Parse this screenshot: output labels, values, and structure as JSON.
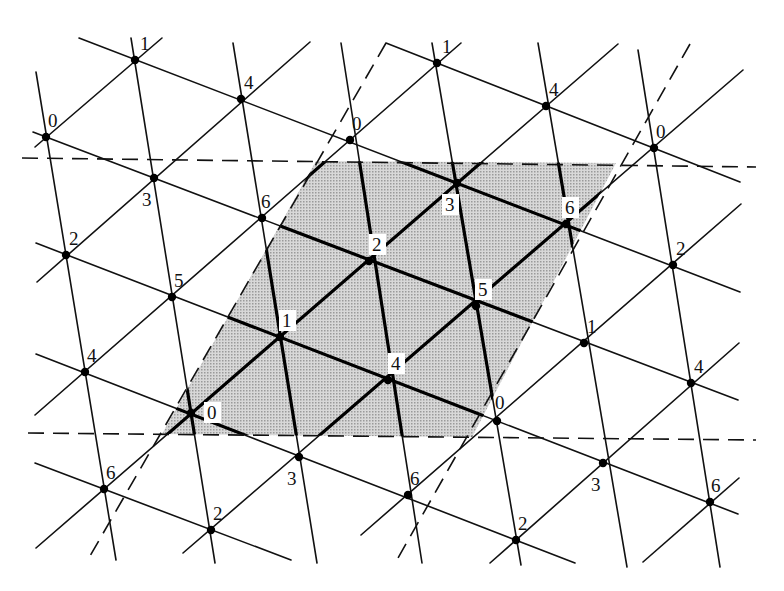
{
  "diagram": {
    "title": "",
    "type": "triangular lattice with residue labels mod 7 and shaded fundamental parallelogram",
    "colors": {
      "line": "#111111",
      "node": "#000000",
      "shade": "#c4c4c4",
      "background": "#ffffff"
    },
    "region": {
      "polygon": [
        [
          316,
          161
        ],
        [
          616,
          163
        ],
        [
          472,
          437
        ],
        [
          162,
          434
        ]
      ]
    },
    "dashed_lines": [
      [
        [
          22,
          158
        ],
        [
          756,
          167
        ]
      ],
      [
        [
          28,
          433
        ],
        [
          756,
          440
        ]
      ],
      [
        [
          386,
          43
        ],
        [
          90,
          556
        ]
      ],
      [
        [
          690,
          44
        ],
        [
          398,
          558
        ]
      ]
    ],
    "lines": [
      [
        [
          35,
          147
        ],
        [
          162,
          38
        ]
      ],
      [
        [
          37,
          282
        ],
        [
          310,
          42
        ]
      ],
      [
        [
          35,
          415
        ],
        [
          461,
          43
        ]
      ],
      [
        [
          36,
          548
        ],
        [
          618,
          44
        ]
      ],
      [
        [
          183,
          553
        ],
        [
          743,
          70
        ]
      ],
      [
        [
          361,
          535
        ],
        [
          741,
          204
        ]
      ],
      [
        [
          490,
          563
        ],
        [
          739,
          343
        ]
      ],
      [
        [
          643,
          562
        ],
        [
          739,
          478
        ]
      ],
      [
        [
          79,
          38
        ],
        [
          740,
          292
        ]
      ],
      [
        [
          33,
          132
        ],
        [
          738,
          400
        ]
      ],
      [
        [
          36,
          243
        ],
        [
          738,
          514
        ]
      ],
      [
        [
          36,
          354
        ],
        [
          575,
          563
        ]
      ],
      [
        [
          35,
          463
        ],
        [
          291,
          560
        ]
      ],
      [
        [
          386,
          43
        ],
        [
          740,
          182
        ]
      ],
      [
        [
          131,
          38
        ],
        [
          215,
          563
        ]
      ],
      [
        [
          36,
          72
        ],
        [
          116,
          560
        ]
      ],
      [
        [
          233,
          43
        ],
        [
          317,
          563
        ]
      ],
      [
        [
          341,
          43
        ],
        [
          422,
          563
        ]
      ],
      [
        [
          432,
          43
        ],
        [
          521,
          565
        ]
      ],
      [
        [
          538,
          43
        ],
        [
          627,
          567
        ]
      ],
      [
        [
          638,
          50
        ],
        [
          720,
          567
        ]
      ]
    ],
    "nodes": [
      {
        "x": 135,
        "y": 60,
        "label": "1",
        "lx": 5,
        "ly": -10
      },
      {
        "x": 241,
        "y": 99,
        "label": "4",
        "lx": 3,
        "ly": -10
      },
      {
        "x": 437,
        "y": 63,
        "label": "1",
        "lx": 5,
        "ly": -10
      },
      {
        "x": 546,
        "y": 106,
        "label": "4",
        "lx": 3,
        "ly": -10
      },
      {
        "x": 46,
        "y": 137,
        "label": "0",
        "lx": 2,
        "ly": -10
      },
      {
        "x": 350,
        "y": 140,
        "label": "0",
        "lx": 2,
        "ly": -10
      },
      {
        "x": 654,
        "y": 148,
        "label": "0",
        "lx": 2,
        "ly": -10
      },
      {
        "x": 154,
        "y": 178,
        "label": "3",
        "lx": -12,
        "ly": 28
      },
      {
        "x": 457,
        "y": 183,
        "label": "3",
        "lx": -12,
        "ly": 28,
        "boxed": true
      },
      {
        "x": 262,
        "y": 218,
        "label": "6",
        "lx": -1,
        "ly": -10
      },
      {
        "x": 566,
        "y": 224,
        "label": "6",
        "lx": -1,
        "ly": -10,
        "boxed": true
      },
      {
        "x": 66,
        "y": 255,
        "label": "2",
        "lx": 3,
        "ly": -10
      },
      {
        "x": 369,
        "y": 261,
        "label": "2",
        "lx": 3,
        "ly": -10,
        "boxed": true
      },
      {
        "x": 673,
        "y": 265,
        "label": "2",
        "lx": 3,
        "ly": -10
      },
      {
        "x": 172,
        "y": 297,
        "label": "5",
        "lx": 2,
        "ly": -10
      },
      {
        "x": 476,
        "y": 306,
        "label": "5",
        "lx": 2,
        "ly": -10,
        "boxed": true
      },
      {
        "x": 280,
        "y": 337,
        "label": "1",
        "lx": 2,
        "ly": -10,
        "boxed": true
      },
      {
        "x": 584,
        "y": 343,
        "label": "1",
        "lx": 3,
        "ly": -10
      },
      {
        "x": 85,
        "y": 372,
        "label": "4",
        "lx": 2,
        "ly": -10
      },
      {
        "x": 388,
        "y": 380,
        "label": "4",
        "lx": 3,
        "ly": -10,
        "boxed": true
      },
      {
        "x": 691,
        "y": 383,
        "label": "4",
        "lx": 3,
        "ly": -10
      },
      {
        "x": 191,
        "y": 413,
        "label": "0",
        "lx": 16,
        "ly": 6,
        "boxed": true
      },
      {
        "x": 497,
        "y": 421,
        "label": "0",
        "lx": -2,
        "ly": -12
      },
      {
        "x": 299,
        "y": 457,
        "label": "3",
        "lx": -12,
        "ly": 28
      },
      {
        "x": 603,
        "y": 463,
        "label": "3",
        "lx": -12,
        "ly": 28
      },
      {
        "x": 104,
        "y": 489,
        "label": "6",
        "lx": 2,
        "ly": -10
      },
      {
        "x": 408,
        "y": 495,
        "label": "6",
        "lx": 2,
        "ly": -10
      },
      {
        "x": 710,
        "y": 502,
        "label": "6",
        "lx": 1,
        "ly": -10
      },
      {
        "x": 211,
        "y": 530,
        "label": "2",
        "lx": 2,
        "ly": -10
      },
      {
        "x": 516,
        "y": 540,
        "label": "2",
        "lx": 2,
        "ly": -10
      }
    ]
  }
}
